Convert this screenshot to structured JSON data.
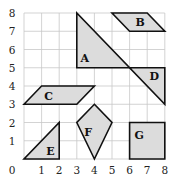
{
  "diagram": {
    "type": "coordinate-grid-shapes",
    "grid": {
      "x_min": 0,
      "x_max": 8,
      "y_min": 0,
      "y_max": 8
    },
    "axis": {
      "origin_label": "0",
      "x_labels": [
        "1",
        "2",
        "3",
        "4",
        "5",
        "6",
        "7",
        "8"
      ],
      "y_labels": [
        "1",
        "2",
        "3",
        "4",
        "5",
        "6",
        "7",
        "8"
      ]
    },
    "colors": {
      "fill": "#dcdcdc",
      "stroke": "#111111",
      "grid": "#c8c8c8"
    },
    "shapes": [
      {
        "label": "A",
        "kind": "right-triangle",
        "vertices": [
          [
            3,
            8
          ],
          [
            3,
            5
          ],
          [
            6,
            5
          ]
        ],
        "label_pos": [
          3.45,
          5.5
        ]
      },
      {
        "label": "B",
        "kind": "parallelogram",
        "vertices": [
          [
            5,
            8
          ],
          [
            7,
            8
          ],
          [
            8,
            7
          ],
          [
            6,
            7
          ]
        ],
        "label_pos": [
          6.6,
          7.5
        ]
      },
      {
        "label": "C",
        "kind": "parallelogram",
        "vertices": [
          [
            0,
            3
          ],
          [
            1,
            4
          ],
          [
            4,
            4
          ],
          [
            3,
            3
          ]
        ],
        "label_pos": [
          1.4,
          3.45
        ]
      },
      {
        "label": "D",
        "kind": "right-triangle",
        "vertices": [
          [
            6,
            5
          ],
          [
            8,
            5
          ],
          [
            8,
            3
          ]
        ],
        "label_pos": [
          7.4,
          4.5
        ]
      },
      {
        "label": "E",
        "kind": "right-triangle",
        "vertices": [
          [
            0,
            0
          ],
          [
            2,
            0
          ],
          [
            2,
            2
          ]
        ],
        "label_pos": [
          1.5,
          0.4
        ]
      },
      {
        "label": "F",
        "kind": "kite",
        "vertices": [
          [
            4,
            3
          ],
          [
            5,
            2
          ],
          [
            4,
            0
          ],
          [
            3,
            2
          ]
        ],
        "label_pos": [
          3.65,
          1.45
        ]
      },
      {
        "label": "G",
        "kind": "square",
        "vertices": [
          [
            6,
            0
          ],
          [
            8,
            0
          ],
          [
            8,
            2
          ],
          [
            6,
            2
          ]
        ],
        "label_pos": [
          6.55,
          1.3
        ]
      }
    ]
  }
}
